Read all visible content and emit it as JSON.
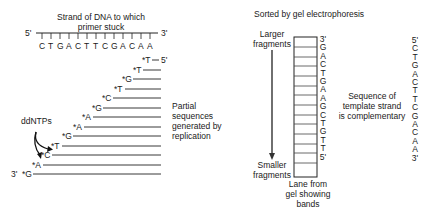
{
  "left_panel": {
    "title_line1": "Strand of DNA to which",
    "title_line2": "primer stuck",
    "template_5_label": "5'",
    "template_3_label": "3'",
    "template_sequence": [
      "C",
      "T",
      "G",
      "A",
      "C",
      "T",
      "T",
      "C",
      "G",
      "A",
      "C",
      "A",
      "A"
    ],
    "fragments": [
      {
        "label": "*T",
        "end": "5'"
      },
      {
        "label": "*T"
      },
      {
        "label": "*G"
      },
      {
        "label": "*T"
      },
      {
        "label": "*C"
      },
      {
        "label": "*G"
      },
      {
        "label": "*A"
      },
      {
        "label": "*A"
      },
      {
        "label": "*G"
      },
      {
        "label": "*T"
      },
      {
        "label": "*C"
      },
      {
        "label": "*A"
      },
      {
        "label": "*G",
        "start": "3'"
      }
    ],
    "ddntps_label": "ddNTPs",
    "partial_label": [
      "Partial",
      "sequences",
      "generated by",
      "replication"
    ]
  },
  "right_panel": {
    "title": "Sorted by gel electrophoresis",
    "larger_label": [
      "Larger",
      "fragments"
    ],
    "smaller_label": [
      "Smaller",
      "fragments"
    ],
    "gel_sequence": [
      "3'",
      "G",
      "A",
      "C",
      "T",
      "G",
      "A",
      "A",
      "G",
      "C",
      "T",
      "G",
      "T",
      "T",
      "5'"
    ],
    "lane_label": [
      "Lane from",
      "gel showing",
      "bands"
    ],
    "complementary_label": [
      "Sequence of",
      "template strand",
      "is complementary"
    ],
    "template_sequence": [
      "5'",
      "C",
      "T",
      "G",
      "A",
      "C",
      "T",
      "T",
      "C",
      "G",
      "A",
      "C",
      "A",
      "A",
      "3'"
    ]
  }
}
